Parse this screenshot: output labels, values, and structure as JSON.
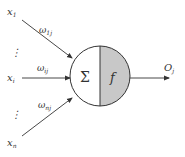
{
  "diagram": {
    "inputs": [
      {
        "symbol": "x",
        "sub": "1",
        "x": 8,
        "y": 15
      },
      {
        "symbol": "x",
        "sub": "i",
        "x": 8,
        "y": 80
      },
      {
        "symbol": "x",
        "sub": "n",
        "x": 8,
        "y": 145
      }
    ],
    "weights": [
      {
        "symbol": "ω",
        "sub": "1j",
        "x": 40,
        "y": 33
      },
      {
        "symbol": "ω",
        "sub": "ij",
        "x": 38,
        "y": 72
      },
      {
        "symbol": "ω",
        "sub": "nj",
        "x": 38,
        "y": 109
      }
    ],
    "ellipsis": [
      {
        "text": "⋮",
        "x": 10,
        "y": 52
      },
      {
        "text": "⋮",
        "x": 10,
        "y": 114
      }
    ],
    "node": {
      "sum_symbol": "Σ",
      "activation_symbol": "f",
      "left_fill": "#ffffff",
      "right_fill": "#c8c8c8"
    },
    "output": {
      "symbol": "O",
      "sub": "j"
    }
  }
}
